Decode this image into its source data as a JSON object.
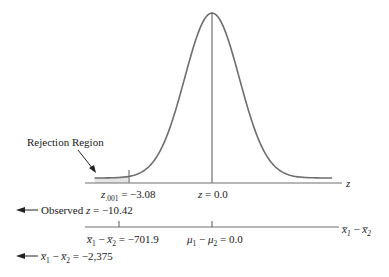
{
  "diagram": {
    "title": "",
    "colors": {
      "curve": "#6e6e6e",
      "axis": "#707070",
      "rejection_fill": "#e4e4e4",
      "text": "#1a1a1a"
    },
    "distribution": "standard-normal",
    "rejection_region": {
      "label": "Rejection Region",
      "tail": "lower"
    },
    "z_axis": {
      "name": "z",
      "critical": {
        "symbol": "z",
        "subscript": ".001",
        "value_text": " = −3.08",
        "value": -3.08
      },
      "center": {
        "symbol": "z",
        "value_text": " = 0.0",
        "value": 0.0
      }
    },
    "observed_z": {
      "prefix": "Observed ",
      "symbol": "z",
      "value_text": " = −10.42",
      "value": -10.42
    },
    "diff_axis": {
      "name_parts": {
        "a": "x̅",
        "a_sub": "1",
        "minus": " − ",
        "b": "x̅",
        "b_sub": "2"
      },
      "critical": {
        "value_text": " = −701.9",
        "value": -701.9
      },
      "center": {
        "a": "μ",
        "a_sub": "1",
        "minus": " − ",
        "b": "μ",
        "b_sub": "2",
        "value_text": " = 0.0",
        "value": 0.0
      }
    },
    "observed_diff": {
      "value_text": " = −2,375",
      "value": -2375
    }
  }
}
